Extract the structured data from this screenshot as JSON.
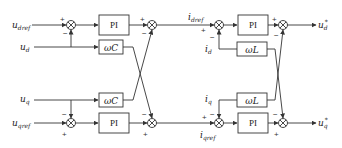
{
  "diagram": {
    "type": "dual-loop dq control block diagram",
    "voltage_loop": {
      "inputs": {
        "d_ref": "u",
        "d_ref_sub": "dref",
        "q_ref": "u",
        "q_ref_sub": "qref",
        "d_fb": "u",
        "d_fb_sub": "d",
        "q_fb": "u",
        "q_fb_sub": "q"
      },
      "controller_d": "PI",
      "controller_q": "PI",
      "coupling_top": "ωC",
      "coupling_bottom": "ωC"
    },
    "current_loop": {
      "inputs": {
        "d_ref": "i",
        "d_ref_sub": "dref",
        "q_ref": "i",
        "q_ref_sub": "qref",
        "d_fb": "i",
        "d_fb_sub": "d",
        "q_fb": "i",
        "q_fb_sub": "q"
      },
      "controller_d": "PI",
      "controller_q": "PI",
      "coupling_top": "ωL",
      "coupling_bottom": "ωL"
    },
    "outputs": {
      "d": "u",
      "d_sub": "d",
      "d_sup": "*",
      "q": "u",
      "q_sub": "q",
      "q_sup": "*"
    },
    "signs": {
      "plus": "+",
      "minus": "−"
    }
  }
}
